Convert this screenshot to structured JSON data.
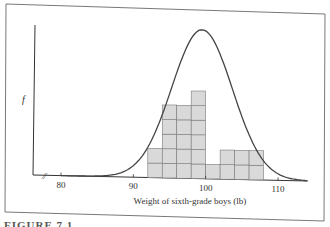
{
  "chart_data": {
    "type": "bar",
    "title": "",
    "xlabel": "Weight of sixth-grade boys (lb)",
    "ylabel": "f",
    "x_ticks": [
      80,
      90,
      100,
      110
    ],
    "xlim": [
      76,
      114
    ],
    "axis_break": true,
    "grid": false,
    "bin_width": 2,
    "categories": [
      "92-94",
      "94-96",
      "96-98",
      "98-100",
      "100-102",
      "102-104",
      "104-106",
      "106-108"
    ],
    "bin_starts": [
      92,
      94,
      96,
      98,
      100,
      102,
      104,
      106
    ],
    "values": [
      2,
      5,
      5,
      6,
      1,
      2,
      2,
      2
    ],
    "overlay": {
      "type": "normal-curve",
      "mean": 99.5,
      "sd": 4.2,
      "peak_count": 10.2
    },
    "colors": {
      "bars": "#d9d9d9",
      "bar_edge": "#7a7a7a",
      "curve": "#444444",
      "axis": "#333333"
    }
  },
  "caption": "FIGURE 7.1"
}
